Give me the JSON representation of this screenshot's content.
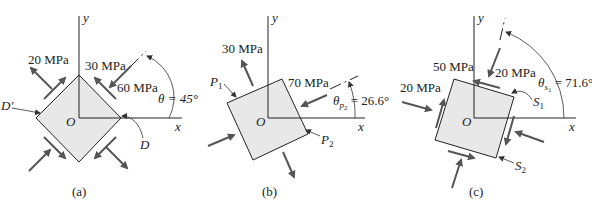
{
  "figure": {
    "colors": {
      "element_fill": "#e8e8e8",
      "line": "#222222",
      "arrow": "#555555"
    },
    "panels": [
      {
        "caption": "(a)",
        "axes": {
          "x_label": "x",
          "y_label": "y",
          "origin_label": "O"
        },
        "labels": {
          "stress_1": "20 MPa",
          "stress_2": "30 MPa",
          "stress_3": "60 MPa",
          "angle": "θ = 45°",
          "point_d": "D",
          "point_d_prime": "D'"
        }
      },
      {
        "caption": "(b)",
        "axes": {
          "x_label": "x",
          "y_label": "y",
          "origin_label": "O"
        },
        "labels": {
          "stress_1": "30 MPa",
          "stress_2": "70 MPa",
          "angle_theta": "θ",
          "angle_sub": "p",
          "angle_subsub": "2",
          "angle_value": " = 26.6°",
          "point_p1": "P",
          "point_p1_sub": "1",
          "point_p2": "P",
          "point_p2_sub": "2"
        }
      },
      {
        "caption": "(c)",
        "axes": {
          "x_label": "x",
          "y_label": "y",
          "origin_label": "O"
        },
        "labels": {
          "stress_1": "50 MPa",
          "stress_2": "20 MPa",
          "stress_3": "20 MPa",
          "angle_theta": "θ",
          "angle_sub": "s",
          "angle_subsub": "1",
          "angle_value": " = 71.6°",
          "point_s1": "S",
          "point_s1_sub": "1",
          "point_s2": "S",
          "point_s2_sub": "2"
        }
      }
    ]
  }
}
